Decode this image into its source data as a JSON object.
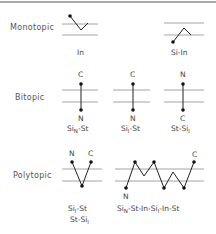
{
  "categories": {
    "monotopic": "Monotopic",
    "bitopic": "Bitopic",
    "polytopic": "Polytopic"
  },
  "monotopic": {
    "diagram1": {
      "label": "In"
    },
    "diagram2": {
      "label": "Si-In"
    }
  },
  "bitopic": {
    "diagram1": {
      "top": "C",
      "bottom": "N",
      "label_main": "Si",
      "label_sub": "N",
      "label_rest": "-St"
    },
    "diagram2": {
      "top": "C",
      "bottom": "N",
      "label_main": "Si",
      "label_sub": "I",
      "label_rest": "-St"
    },
    "diagram3": {
      "top": "N",
      "bottom": "C",
      "label_main": "St-Si",
      "label_sub": "I",
      "label_rest": ""
    }
  },
  "polytopic": {
    "diagram1": {
      "left_term": "N",
      "right_term": "C",
      "line1_main": "Si",
      "line1_sub": "I",
      "line1_rest": "-St",
      "line2_main": "St-Si",
      "line2_sub": "I"
    },
    "diagram2": {
      "start_term": "N",
      "end_term": "C",
      "label_part1": "Si",
      "label_sub1": "N",
      "label_part2": "-St-In-Si",
      "label_sub2": "I",
      "label_part3": "-In-St"
    }
  },
  "colors": {
    "membrane": "#9a9a9a",
    "chain": "#222222",
    "text": "#444444"
  }
}
